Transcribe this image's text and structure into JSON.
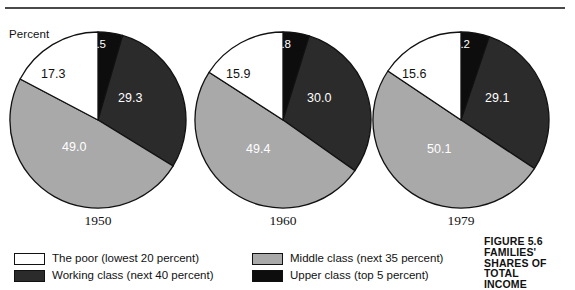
{
  "axis_label": "Percent",
  "caption": {
    "lines": [
      "FIGURE 5.6",
      "FAMILIES'",
      "SHARES OF",
      "TOTAL",
      "INCOME"
    ]
  },
  "legend": {
    "items": [
      {
        "label": "The poor (lowest 20 percent)",
        "color": "#ffffff",
        "col": 0,
        "row": 0,
        "key": "poor"
      },
      {
        "label": "Working class (next 40 percent)",
        "color": "#2b2b2b",
        "col": 0,
        "row": 1,
        "key": "working"
      },
      {
        "label": "Middle class (next 35 percent)",
        "color": "#a9a9a9",
        "col": 1,
        "row": 0,
        "key": "middle"
      },
      {
        "label": "Upper class (top 5 percent)",
        "color": "#0d0d0d",
        "col": 1,
        "row": 1,
        "key": "upper"
      }
    ]
  },
  "chart_data": {
    "type": "pie",
    "ylabel": "Percent",
    "legend_position": "bottom",
    "grid": false,
    "categories": [
      "Upper class (top 5 percent)",
      "Working class (next 40 percent)",
      "Middle class (next 35 percent)",
      "The poor (lowest 20 percent)"
    ],
    "colors": [
      "#0d0d0d",
      "#2b2b2b",
      "#a9a9a9",
      "#ffffff"
    ],
    "pies": [
      {
        "year": "1950",
        "slices": [
          {
            "category": "Upper class (top 5 percent)",
            "value": 4.5,
            "label": "4.5",
            "color": "#0d0d0d",
            "label_on_light": false,
            "label_left": 81,
            "label_top": 7
          },
          {
            "category": "Working class (next 40 percent)",
            "value": 29.3,
            "label": "29.3",
            "color": "#2b2b2b",
            "label_on_light": false,
            "label_left": 109,
            "label_top": 60
          },
          {
            "category": "Middle class (next 35 percent)",
            "value": 49.0,
            "label": "49.0",
            "color": "#a9a9a9",
            "label_on_light": false,
            "label_left": 53,
            "label_top": 109
          },
          {
            "category": "The poor (lowest 20 percent)",
            "value": 17.3,
            "label": "17.3",
            "color": "#ffffff",
            "label_on_light": true,
            "label_left": 32,
            "label_top": 36
          }
        ]
      },
      {
        "year": "1960",
        "slices": [
          {
            "category": "Upper class (top 5 percent)",
            "value": 4.8,
            "label": "4.8",
            "color": "#0d0d0d",
            "label_on_light": false,
            "label_left": 81,
            "label_top": 7
          },
          {
            "category": "Working class (next 40 percent)",
            "value": 30.0,
            "label": "30.0",
            "color": "#2b2b2b",
            "label_on_light": false,
            "label_left": 113,
            "label_top": 60
          },
          {
            "category": "Middle class (next 35 percent)",
            "value": 49.4,
            "label": "49.4",
            "color": "#a9a9a9",
            "label_on_light": false,
            "label_left": 52,
            "label_top": 111
          },
          {
            "category": "The poor (lowest 20 percent)",
            "value": 15.9,
            "label": "15.9",
            "color": "#ffffff",
            "label_on_light": true,
            "label_left": 32,
            "label_top": 36
          }
        ]
      },
      {
        "year": "1979",
        "slices": [
          {
            "category": "Upper class (top 5 percent)",
            "value": 5.2,
            "label": "5.2",
            "color": "#0d0d0d",
            "label_on_light": false,
            "label_left": 82,
            "label_top": 7
          },
          {
            "category": "Working class (next 40 percent)",
            "value": 29.1,
            "label": "29.1",
            "color": "#2b2b2b",
            "label_on_light": false,
            "label_left": 113,
            "label_top": 60
          },
          {
            "category": "Middle class (next 35 percent)",
            "value": 50.1,
            "label": "50.1",
            "color": "#a9a9a9",
            "label_on_light": false,
            "label_left": 55,
            "label_top": 111
          },
          {
            "category": "The poor (lowest 20 percent)",
            "value": 15.6,
            "label": "15.6",
            "color": "#ffffff",
            "label_on_light": true,
            "label_left": 30,
            "label_top": 36
          }
        ]
      }
    ]
  }
}
